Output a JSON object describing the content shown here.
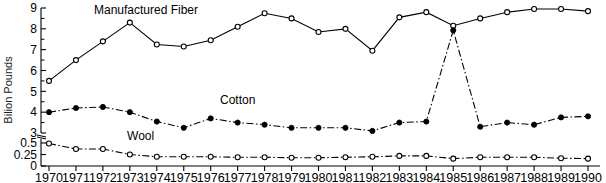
{
  "chart_data": {
    "type": "line",
    "title": "",
    "xlabel": "",
    "ylabel": "Bilion Pounds",
    "grid": false,
    "legend_position": "inline-annotations",
    "axis_note": "Y axis is broken between 0.5 and 3",
    "y_segments": [
      {
        "range": [
          0,
          0.5
        ],
        "ticks": [
          0,
          0.25,
          0.5
        ]
      },
      {
        "range": [
          3,
          9
        ],
        "ticks": [
          3,
          4,
          5,
          6,
          7,
          8,
          9
        ]
      }
    ],
    "ytick_labels": [
      "0",
      "0.25",
      "0.5",
      "3",
      "4",
      "5",
      "6",
      "7",
      "8",
      "9"
    ],
    "x": [
      1970,
      1971,
      1972,
      1973,
      1974,
      1975,
      1976,
      1977,
      1978,
      1979,
      1980,
      1981,
      1982,
      1983,
      1984,
      1985,
      1986,
      1987,
      1988,
      1989,
      1990
    ],
    "xtick_labels": [
      "1970",
      "1971",
      "1972",
      "1973",
      "1974",
      "1975",
      "1976",
      "1977",
      "1978",
      "1979",
      "1980",
      "1981",
      "1982",
      "1983",
      "1984",
      "1985",
      "1986",
      "1987",
      "1988",
      "1989",
      "1990"
    ],
    "series": [
      {
        "name": "Manufactured Fiber",
        "label": "Manufactured Fiber",
        "marker": "open-circle",
        "line_style": "solid",
        "color": "#000000",
        "values": [
          5.5,
          6.5,
          7.4,
          8.3,
          7.25,
          7.15,
          7.45,
          8.1,
          8.75,
          8.5,
          7.85,
          8.0,
          6.95,
          8.55,
          8.8,
          8.15,
          8.5,
          8.8,
          8.95,
          8.95,
          8.85
        ]
      },
      {
        "name": "Cotton",
        "label": "Cotton",
        "marker": "filled-circle",
        "line_style": "dash-dot",
        "color": "#000000",
        "values": [
          4.0,
          4.2,
          4.25,
          4.0,
          3.55,
          3.25,
          3.7,
          3.5,
          3.4,
          3.25,
          3.25,
          3.25,
          3.1,
          3.5,
          3.55,
          2.95,
          3.3,
          3.5,
          3.4,
          3.75,
          3.8
        ]
      },
      {
        "name": "Wool",
        "label": "Wool",
        "marker": "open-circle",
        "line_style": "dash-dot",
        "color": "#000000",
        "values": [
          0.49,
          0.37,
          0.37,
          0.25,
          0.2,
          0.2,
          0.2,
          0.19,
          0.19,
          0.18,
          0.18,
          0.19,
          0.2,
          0.22,
          0.22,
          0.16,
          0.19,
          0.19,
          0.19,
          0.17,
          0.16
        ]
      }
    ],
    "annotations": [
      {
        "text": "Manufactured Fiber",
        "x": 1973.6,
        "y_px": 14
      },
      {
        "text": "Cotton",
        "x": 1977.0,
        "y_px": 104
      },
      {
        "text": "Wool",
        "x": 1973.4,
        "y_px": 140
      }
    ]
  }
}
